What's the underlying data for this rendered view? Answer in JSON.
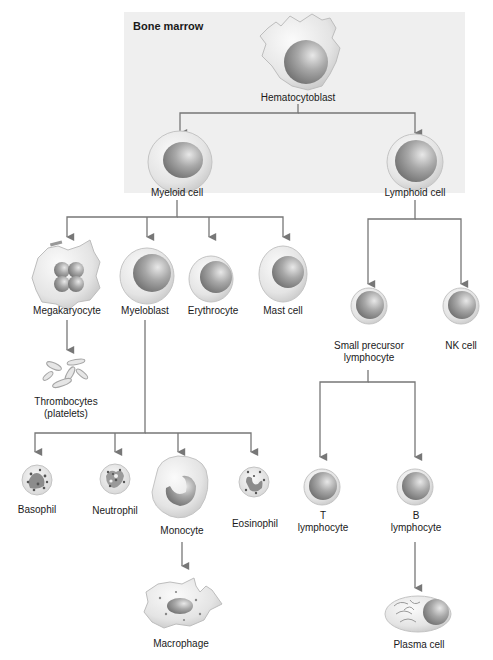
{
  "region": {
    "label": "Bone marrow"
  },
  "colors": {
    "background": "#ffffff",
    "marrow_box": "#efefef",
    "line": "#777777",
    "cell_outer": "#e2e2e2",
    "cell_nucleus": "#9a9a9a",
    "text": "#1a1a1a"
  },
  "nodes": {
    "hematocytoblast": {
      "label": "Hematocytoblast"
    },
    "myeloid": {
      "label": "Myeloid cell"
    },
    "lymphoid": {
      "label": "Lymphoid cell"
    },
    "megakaryocyte": {
      "label": "Megakaryocyte"
    },
    "myeloblast": {
      "label": "Myeloblast"
    },
    "erythrocyte": {
      "label": "Erythrocyte"
    },
    "mast": {
      "label": "Mast cell"
    },
    "thrombocytes": {
      "label_line1": "Thrombocytes",
      "label_line2": "(platelets)"
    },
    "small_precursor": {
      "label_line1": "Small precursor",
      "label_line2": "lymphocyte"
    },
    "nk": {
      "label": "NK cell"
    },
    "basophil": {
      "label": "Basophil"
    },
    "neutrophil": {
      "label": "Neutrophil"
    },
    "monocyte": {
      "label": "Monocyte"
    },
    "eosinophil": {
      "label": "Eosinophil"
    },
    "t_lymphocyte": {
      "label_line1": "T",
      "label_line2": "lymphocyte"
    },
    "b_lymphocyte": {
      "label_line1": "B",
      "label_line2": "lymphocyte"
    },
    "macrophage": {
      "label": "Macrophage"
    },
    "plasma": {
      "label": "Plasma cell"
    }
  },
  "edges": [
    [
      "Hematocytoblast",
      "Myeloid cell"
    ],
    [
      "Hematocytoblast",
      "Lymphoid cell"
    ],
    [
      "Myeloid cell",
      "Megakaryocyte"
    ],
    [
      "Myeloid cell",
      "Myeloblast"
    ],
    [
      "Myeloid cell",
      "Erythrocyte"
    ],
    [
      "Myeloid cell",
      "Mast cell"
    ],
    [
      "Megakaryocyte",
      "Thrombocytes (platelets)"
    ],
    [
      "Myeloblast",
      "Basophil"
    ],
    [
      "Myeloblast",
      "Neutrophil"
    ],
    [
      "Myeloblast",
      "Monocyte"
    ],
    [
      "Myeloblast",
      "Eosinophil"
    ],
    [
      "Monocyte",
      "Macrophage"
    ],
    [
      "Lymphoid cell",
      "Small precursor lymphocyte"
    ],
    [
      "Lymphoid cell",
      "NK cell"
    ],
    [
      "Small precursor lymphocyte",
      "T lymphocyte"
    ],
    [
      "Small precursor lymphocyte",
      "B lymphocyte"
    ],
    [
      "B lymphocyte",
      "Plasma cell"
    ]
  ]
}
